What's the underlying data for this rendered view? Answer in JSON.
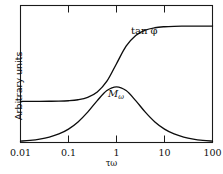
{
  "figure": {
    "background_color": "#ffffff",
    "frame_color": "#1a1a1a",
    "curve_color": "#0d0d0d"
  },
  "axes": {
    "x": {
      "label": "τω",
      "scale": "log",
      "range": [
        0.01,
        100
      ],
      "tick_labels": [
        "0.01",
        "0.1",
        "1",
        "10",
        "100"
      ],
      "tick_values": [
        0.01,
        0.1,
        1,
        10,
        100
      ],
      "ticks_on_top": true
    },
    "y": {
      "label": "Arbitrary units",
      "tick_labels": [],
      "range": [
        0,
        1
      ]
    }
  },
  "annotations": {
    "tan_phi_label": "tan φ",
    "m_omega_label_base": "M",
    "m_omega_label_sub": "ω"
  },
  "chart_data": {
    "type": "line",
    "title": "",
    "xlabel": "τω",
    "ylabel": "Arbitrary units",
    "xscale": "log",
    "xlim": [
      0.01,
      100
    ],
    "ylim": [
      0,
      1
    ],
    "grid": false,
    "legend": "inline-annotations",
    "series": [
      {
        "name": "tan φ",
        "description": "Debye loss peak: bell-shaped curve peaking at τω = 1",
        "x": [
          0.01,
          0.0158,
          0.0251,
          0.0398,
          0.0631,
          0.1,
          0.158,
          0.251,
          0.398,
          0.631,
          1.0,
          1.585,
          2.512,
          3.981,
          6.31,
          10.0,
          15.85,
          25.12,
          39.81,
          63.1,
          100.0
        ],
        "y": [
          0.0099,
          0.0158,
          0.0251,
          0.0397,
          0.0626,
          0.098,
          0.1502,
          0.2216,
          0.3058,
          0.3791,
          0.4065,
          0.3791,
          0.3058,
          0.2216,
          0.1502,
          0.098,
          0.0626,
          0.0397,
          0.0251,
          0.0158,
          0.0099
        ]
      },
      {
        "name": "Mω",
        "description": "Dispersion sigmoid rising from low plateau to high plateau across τω = 1",
        "x": [
          0.01,
          0.0158,
          0.0251,
          0.0398,
          0.0631,
          0.1,
          0.158,
          0.251,
          0.398,
          0.631,
          1.0,
          1.585,
          2.512,
          3.981,
          6.31,
          10.0,
          15.85,
          25.12,
          39.81,
          63.1,
          100.0
        ],
        "y": [
          0.3,
          0.3001,
          0.3003,
          0.3008,
          0.3019,
          0.3049,
          0.3122,
          0.3296,
          0.3687,
          0.4473,
          0.575,
          0.7027,
          0.7813,
          0.8204,
          0.8378,
          0.8451,
          0.8481,
          0.8492,
          0.8497,
          0.8499,
          0.85
        ]
      }
    ]
  }
}
